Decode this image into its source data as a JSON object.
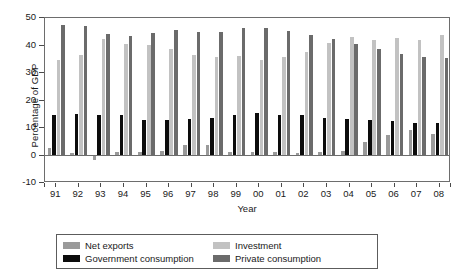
{
  "chart_data": {
    "type": "bar",
    "title": "",
    "xlabel": "Year",
    "ylabel": "Percentage of GDP",
    "ylim": [
      -10,
      50
    ],
    "yticks": [
      -10,
      0,
      10,
      20,
      30,
      40,
      50
    ],
    "grid": false,
    "legend_position": "bottom",
    "categories": [
      "91",
      "92",
      "93",
      "94",
      "95",
      "96",
      "97",
      "98",
      "99",
      "00",
      "01",
      "02",
      "03",
      "04",
      "05",
      "06",
      "07",
      "08"
    ],
    "series": [
      {
        "name": "Net exports",
        "color": "#9a9a9a",
        "values": [
          2.6,
          0.8,
          -1.6,
          1.2,
          1.3,
          1.7,
          4.0,
          3.8,
          1.2,
          1.3,
          1.3,
          1.0,
          1.3,
          1.6,
          5.0,
          7.6,
          9.2,
          7.8
        ]
      },
      {
        "name": "Government consumption",
        "color": "#0c0c0c",
        "values": [
          14.8,
          15.0,
          14.8,
          14.6,
          12.8,
          13.0,
          13.2,
          13.8,
          14.6,
          15.6,
          14.8,
          14.6,
          13.6,
          13.2,
          12.8,
          12.6,
          11.8,
          12.0
        ]
      },
      {
        "name": "Investment",
        "color": "#c2c2c2",
        "values": [
          34.9,
          36.5,
          42.4,
          40.4,
          40.1,
          38.6,
          36.5,
          35.9,
          36.2,
          34.8,
          36.0,
          37.7,
          41.0,
          43.0,
          42.0,
          42.6,
          42.0,
          43.8
        ]
      },
      {
        "name": "Private consumption",
        "color": "#6b6b6b",
        "values": [
          47.5,
          47.0,
          44.2,
          43.3,
          44.6,
          45.5,
          44.9,
          45.0,
          46.2,
          46.4,
          45.3,
          44.0,
          42.2,
          40.6,
          38.8,
          36.8,
          36.0,
          35.4
        ]
      }
    ]
  },
  "axes": {
    "y_title": "Percentage of GDP",
    "x_title": "Year"
  },
  "legend": {
    "items": [
      {
        "label": "Net exports",
        "color": "#9a9a9a"
      },
      {
        "label": "Investment",
        "color": "#c2c2c2"
      },
      {
        "label": "Government consumption",
        "color": "#0c0c0c"
      },
      {
        "label": "Private consumption",
        "color": "#6b6b6b"
      }
    ]
  }
}
